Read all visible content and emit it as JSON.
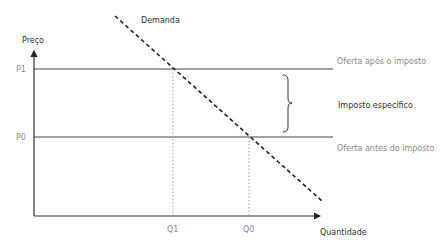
{
  "diagram": {
    "axes": {
      "y_label": "Preço",
      "x_label": "Quantidade"
    },
    "price_labels": {
      "p1": "P1",
      "p0": "P0"
    },
    "quantity_labels": {
      "q1": "Q1",
      "q0": "Q0"
    },
    "curves": {
      "demand": "Demanda",
      "supply_after_tax": "Oferta após o imposto",
      "supply_before_tax": "Oferta antes do imposto"
    },
    "annotation": {
      "tax_brace": "Imposto específico"
    },
    "colors": {
      "axis": "#333333",
      "supply_lines": "#444444",
      "demand_line": "#222222",
      "guide_lines": "#9a9a9a",
      "muted_text": "#8a8a8a",
      "dark_text": "#333333"
    }
  }
}
